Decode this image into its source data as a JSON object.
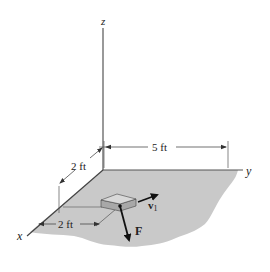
{
  "diagram": {
    "axes": {
      "x": "x",
      "y": "y",
      "z": "z"
    },
    "dimensions": {
      "along_y": "5 ft",
      "along_x_back": "2 ft",
      "along_x_front": "2 ft"
    },
    "vectors": {
      "velocity": "v",
      "velocity_subscript": "1",
      "force": "F"
    },
    "colors": {
      "ground": "#c9c9c9",
      "block_top": "#d8d8d8",
      "block_side": "#a8a8a8",
      "line": "#333333",
      "axis": "#555555"
    }
  }
}
